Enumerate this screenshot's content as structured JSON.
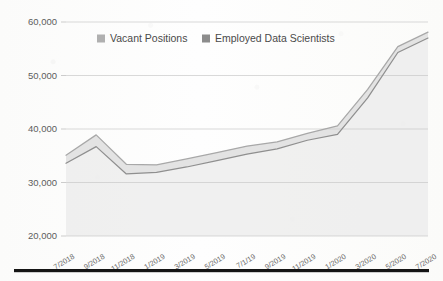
{
  "chart_data": {
    "type": "area",
    "title": "",
    "subtitle": "",
    "xlabel": "",
    "ylabel": "",
    "ylim": [
      20000,
      60000
    ],
    "ytick_step": 10000,
    "ytick_labels": [
      "60,000",
      "50,000",
      "40,000",
      "30,000",
      "20,000"
    ],
    "ytick_values": [
      60000,
      50000,
      40000,
      30000,
      20000
    ],
    "grid": true,
    "legend_position": "top-center",
    "categories": [
      "7/2018",
      "9/2018",
      "11/2018",
      "1/2019",
      "3/2019",
      "5/2019",
      "7/1/19",
      "9/2019",
      "11/2019",
      "1/2020",
      "3/2020",
      "5/2020",
      "7/2020"
    ],
    "x_tick_labels_rotated": true,
    "series": [
      {
        "name": "Vacant Positions",
        "color": "#a8a8a8",
        "values": [
          35100,
          38900,
          33400,
          33300,
          34400,
          35600,
          36800,
          37600,
          39200,
          40600,
          47400,
          55400,
          58100
        ]
      },
      {
        "name": "Employed Data Scientists",
        "color": "#8f8f8f",
        "values": [
          33600,
          36700,
          31600,
          31900,
          32900,
          34100,
          35300,
          36300,
          37900,
          39000,
          45800,
          54300,
          57000
        ]
      }
    ]
  },
  "legend": {
    "items": [
      {
        "label": "Vacant Positions",
        "swatch": "#b0b0b0"
      },
      {
        "label": "Employed Data Scientists",
        "swatch": "#8c8c8c"
      }
    ]
  },
  "page": {
    "bottom_rule_visible": true
  }
}
